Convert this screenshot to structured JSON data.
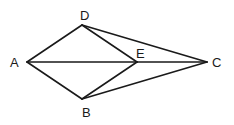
{
  "diagram": {
    "type": "geometry",
    "points": [
      {
        "id": "A",
        "label": "A",
        "x": 27,
        "y": 62,
        "lx": 10,
        "ly": 67
      },
      {
        "id": "D",
        "label": "D",
        "x": 82,
        "y": 25,
        "lx": 80,
        "ly": 20
      },
      {
        "id": "B",
        "label": "B",
        "x": 82,
        "y": 99,
        "lx": 82,
        "ly": 117
      },
      {
        "id": "E",
        "label": "E",
        "x": 137,
        "y": 62,
        "lx": 136,
        "ly": 58
      },
      {
        "id": "C",
        "label": "C",
        "x": 207,
        "y": 62,
        "lx": 212,
        "ly": 67
      }
    ],
    "segments": [
      {
        "from": "A",
        "to": "D"
      },
      {
        "from": "A",
        "to": "B"
      },
      {
        "from": "A",
        "to": "E"
      },
      {
        "from": "E",
        "to": "C"
      },
      {
        "from": "D",
        "to": "E"
      },
      {
        "from": "D",
        "to": "C"
      },
      {
        "from": "B",
        "to": "E"
      },
      {
        "from": "B",
        "to": "C"
      }
    ]
  }
}
